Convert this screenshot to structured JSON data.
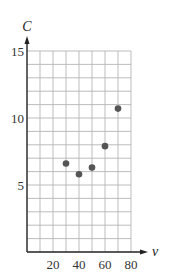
{
  "chart_data": {
    "type": "scatter",
    "title": "",
    "xlabel": "v",
    "ylabel": "C",
    "xlim": [
      0,
      80
    ],
    "ylim": [
      0,
      15
    ],
    "x_ticks": [
      20,
      40,
      60,
      80
    ],
    "y_ticks": [
      5,
      10,
      15
    ],
    "x_grid_step": 10,
    "y_grid_step": 1,
    "grid": true,
    "legend": null,
    "series": [
      {
        "name": "data",
        "points": [
          {
            "x": 30,
            "y": 6.6
          },
          {
            "x": 40,
            "y": 5.8
          },
          {
            "x": 50,
            "y": 6.3
          },
          {
            "x": 60,
            "y": 7.9
          },
          {
            "x": 70,
            "y": 10.7
          }
        ]
      }
    ]
  },
  "colors": {
    "grid": "#b5b5b5",
    "axis": "#222222",
    "point": "#555555"
  }
}
